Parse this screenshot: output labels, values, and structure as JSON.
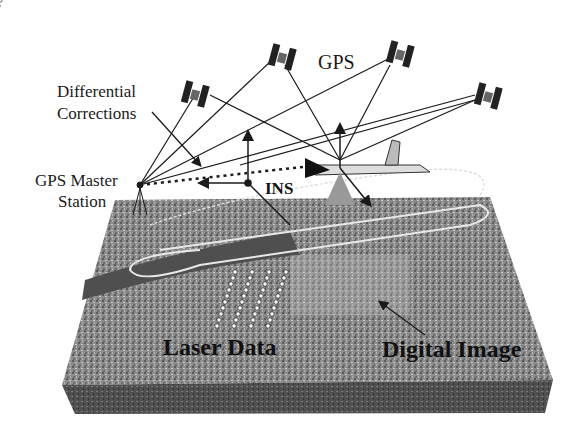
{
  "labels": {
    "gps": "GPS",
    "differential_line1": "Differential",
    "differential_line2": "Corrections",
    "master_line1": "GPS Master",
    "master_line2": "Station",
    "ins": "INS",
    "laser_data": "Laser Data",
    "digital_image": "Digital Image"
  },
  "colors": {
    "background": "#ffffff",
    "terrain": "#8a8a8a",
    "terrain_side": "#4a4a4a",
    "river": "#555555",
    "line": "#1a1a1a"
  }
}
